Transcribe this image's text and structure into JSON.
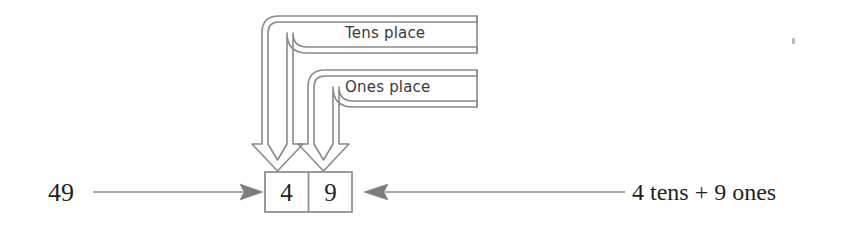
{
  "diagram": {
    "source_number": "49",
    "expanded_form": "4 tens + 9 ones",
    "callouts": [
      {
        "id": "tens",
        "label": "Tens place",
        "points_to": "4"
      },
      {
        "id": "ones",
        "label": "Ones place",
        "points_to": "9"
      }
    ],
    "place_value_box": {
      "cells": [
        {
          "place": "tens",
          "digit": "4"
        },
        {
          "place": "ones",
          "digit": "9"
        }
      ]
    },
    "arrows": [
      {
        "name": "source-to-box",
        "direction": "right",
        "from": "49",
        "to": "place-value-box"
      },
      {
        "name": "expanded-to-box",
        "direction": "left",
        "from": "4 tens + 9 ones",
        "to": "place-value-box"
      },
      {
        "name": "tens-callout-arrow",
        "direction": "down",
        "to": "tens-cell"
      },
      {
        "name": "ones-callout-arrow",
        "direction": "down",
        "to": "ones-cell"
      }
    ],
    "colors": {
      "stroke": "#8a8a8a",
      "arrow_fill": "#7d7d7d",
      "text": "#262626",
      "background": "#ffffff"
    }
  }
}
